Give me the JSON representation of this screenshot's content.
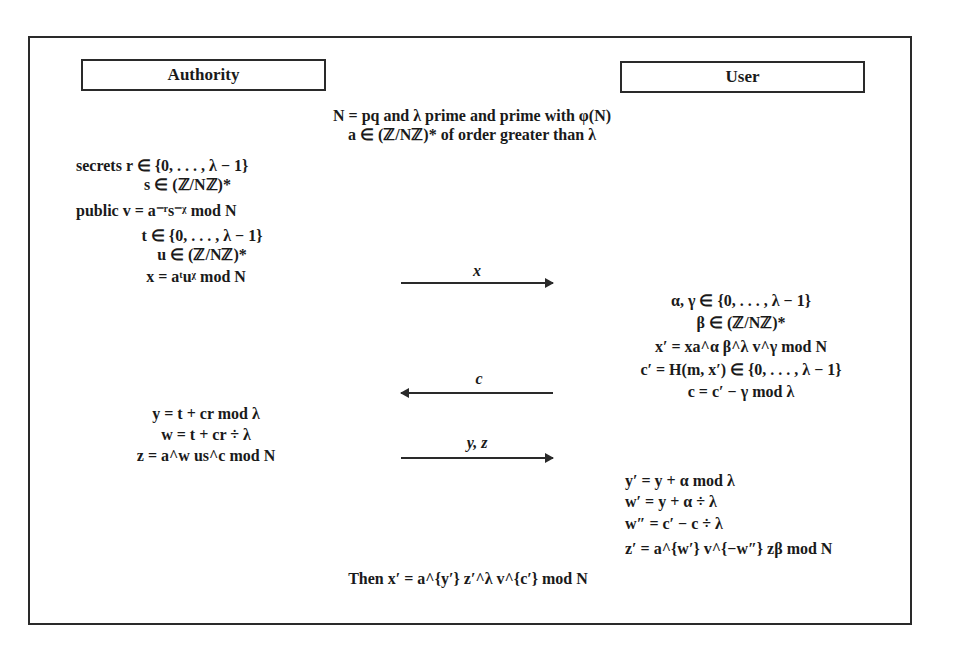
{
  "diagram": {
    "type": "cryptographic-protocol",
    "parties": {
      "left": "Authority",
      "right": "User"
    },
    "setup": [
      "N = pq and λ prime and prime with φ(N)",
      "a ∈ (ℤ/Nℤ)* of order greater than λ"
    ],
    "authority_keys": [
      "secrets  r ∈ {0, . . . , λ − 1}",
      "s ∈ (ℤ/Nℤ)*",
      "public  v = a⁻ʳs⁻ᵡ mod N"
    ],
    "authority_commit": [
      "t ∈ {0, . . . , λ − 1}",
      "u ∈ (ℤ/Nℤ)*",
      "x = aᵗuᵡ mod N"
    ],
    "messages": [
      {
        "label": "x",
        "direction": "right"
      },
      {
        "label": "c",
        "direction": "left"
      },
      {
        "label": "y, z",
        "direction": "right"
      }
    ],
    "user_blind": [
      "α, γ ∈ {0, . . . , λ − 1}",
      "β ∈ (ℤ/Nℤ)*",
      "x′ = xa^α β^λ v^γ mod N",
      "c′ = H(m, x′) ∈ {0, . . . , λ − 1}",
      "c = c′ − γ mod λ"
    ],
    "authority_response": [
      "y = t + cr mod λ",
      "w = t + cr ÷ λ",
      "z = a^w us^c mod N"
    ],
    "user_unblind": [
      "y′ = y + α mod λ",
      "w′ = y + α ÷ λ",
      "w″ = c′ − c ÷ λ",
      "z′ = a^{w′} v^{−w″} zβ mod N"
    ],
    "conclusion": "Then x′ = a^{y′} z′^λ v^{c′} mod N"
  }
}
